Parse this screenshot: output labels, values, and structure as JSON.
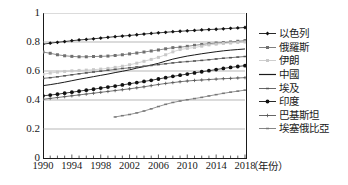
{
  "chart_data": {
    "type": "line",
    "title": "",
    "subtitle": "",
    "xlabel": "（年份）",
    "ylabel": "",
    "xlim": [
      1990,
      2018
    ],
    "ylim": [
      0,
      1
    ],
    "grid": true,
    "grid_axis": "y",
    "legend_position": "right",
    "x": [
      1990,
      1991,
      1992,
      1993,
      1994,
      1995,
      1996,
      1997,
      1998,
      1999,
      2000,
      2001,
      2002,
      2003,
      2004,
      2005,
      2006,
      2007,
      2008,
      2009,
      2010,
      2011,
      2012,
      2013,
      2014,
      2015,
      2016,
      2017,
      2018
    ],
    "xticks": [
      1990,
      1994,
      1998,
      2002,
      2006,
      2010,
      2014,
      2018
    ],
    "xtick_labels": [
      "1990",
      "1994",
      "1998",
      "2002",
      "2006",
      "2010",
      "2014",
      "2018"
    ],
    "yticks": [
      0,
      0.2,
      0.4,
      0.6,
      0.8,
      1
    ],
    "ytick_labels": [
      "0",
      "0.2",
      "0.4",
      "0.6",
      "0.8",
      "1"
    ],
    "series": [
      {
        "name": "以色列",
        "marker": "diamond",
        "color": "#111111",
        "line": "solid",
        "values": [
          0.785,
          0.792,
          0.798,
          0.803,
          0.809,
          0.814,
          0.818,
          0.822,
          0.827,
          0.832,
          0.837,
          0.841,
          0.845,
          0.85,
          0.855,
          0.859,
          0.863,
          0.867,
          0.871,
          0.874,
          0.877,
          0.88,
          0.883,
          0.886,
          0.888,
          0.891,
          0.894,
          0.897,
          0.9
        ]
      },
      {
        "name": "俄羅斯",
        "marker": "square",
        "color": "#707070",
        "line": "solid",
        "values": [
          0.731,
          0.722,
          0.712,
          0.705,
          0.701,
          0.698,
          0.698,
          0.7,
          0.701,
          0.703,
          0.707,
          0.712,
          0.718,
          0.724,
          0.731,
          0.738,
          0.745,
          0.753,
          0.761,
          0.764,
          0.77,
          0.777,
          0.783,
          0.789,
          0.793,
          0.796,
          0.8,
          0.805,
          0.81
        ]
      },
      {
        "name": "伊朗",
        "marker": "square",
        "color": "#c8c8c8",
        "line": "solid",
        "values": [
          0.577,
          0.586,
          0.592,
          0.597,
          0.601,
          0.604,
          0.606,
          0.609,
          0.613,
          0.618,
          0.625,
          0.633,
          0.643,
          0.654,
          0.667,
          0.68,
          0.694,
          0.712,
          0.732,
          0.748,
          0.756,
          0.762,
          0.771,
          0.78,
          0.785,
          0.79,
          0.793,
          0.797,
          0.8
        ]
      },
      {
        "name": "中國",
        "marker": "none",
        "color": "#1a1a1a",
        "line": "solid",
        "values": [
          0.499,
          0.506,
          0.514,
          0.523,
          0.533,
          0.543,
          0.552,
          0.561,
          0.57,
          0.579,
          0.589,
          0.598,
          0.608,
          0.62,
          0.63,
          0.641,
          0.653,
          0.668,
          0.682,
          0.693,
          0.703,
          0.711,
          0.719,
          0.726,
          0.733,
          0.739,
          0.744,
          0.748,
          0.752
        ]
      },
      {
        "name": "埃及",
        "marker": "dash",
        "color": "#555555",
        "line": "solid",
        "values": [
          0.549,
          0.554,
          0.56,
          0.567,
          0.574,
          0.581,
          0.587,
          0.593,
          0.599,
          0.605,
          0.611,
          0.617,
          0.622,
          0.628,
          0.633,
          0.638,
          0.644,
          0.65,
          0.656,
          0.661,
          0.665,
          0.669,
          0.673,
          0.678,
          0.683,
          0.688,
          0.692,
          0.696,
          0.7
        ]
      },
      {
        "name": "印度",
        "marker": "circle",
        "color": "#111111",
        "line": "solid",
        "values": [
          0.429,
          0.434,
          0.44,
          0.447,
          0.454,
          0.461,
          0.468,
          0.475,
          0.482,
          0.489,
          0.496,
          0.504,
          0.512,
          0.52,
          0.528,
          0.536,
          0.545,
          0.554,
          0.563,
          0.571,
          0.579,
          0.587,
          0.595,
          0.602,
          0.61,
          0.618,
          0.625,
          0.631,
          0.637
        ]
      },
      {
        "name": "巴基斯坦",
        "marker": "plus",
        "color": "#555555",
        "line": "solid",
        "values": [
          0.405,
          0.411,
          0.417,
          0.423,
          0.429,
          0.435,
          0.441,
          0.447,
          0.453,
          0.459,
          0.465,
          0.471,
          0.477,
          0.484,
          0.491,
          0.499,
          0.507,
          0.514,
          0.52,
          0.526,
          0.531,
          0.535,
          0.538,
          0.541,
          0.544,
          0.547,
          0.549,
          0.552,
          0.554
        ]
      },
      {
        "name": "埃塞俄比亞",
        "marker": "dash",
        "color": "#777777",
        "line": "solid",
        "values": [
          null,
          null,
          null,
          null,
          null,
          null,
          null,
          null,
          null,
          null,
          0.283,
          0.292,
          0.3,
          0.311,
          0.324,
          0.339,
          0.355,
          0.37,
          0.383,
          0.393,
          0.402,
          0.41,
          0.418,
          0.428,
          0.437,
          0.446,
          0.454,
          0.461,
          0.468
        ]
      }
    ]
  },
  "legend": {
    "items": [
      {
        "label": "以色列"
      },
      {
        "label": "俄羅斯"
      },
      {
        "label": "伊朗"
      },
      {
        "label": "中國"
      },
      {
        "label": "埃及"
      },
      {
        "label": "印度"
      },
      {
        "label": "巴基斯坦"
      },
      {
        "label": "埃塞俄比亞"
      }
    ]
  }
}
